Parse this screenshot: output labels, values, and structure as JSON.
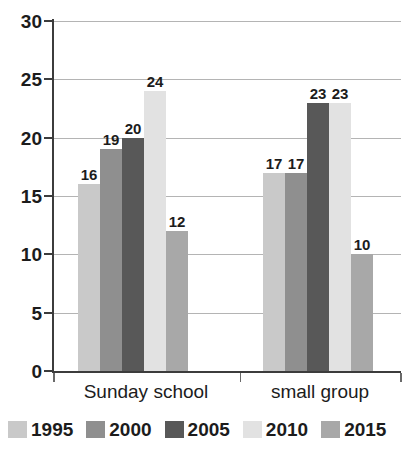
{
  "chart_data": {
    "type": "bar",
    "title": "",
    "xlabel": "",
    "ylabel": "",
    "ylim": [
      0,
      30
    ],
    "yticks": [
      0,
      5,
      10,
      15,
      20,
      25,
      30
    ],
    "grid": true,
    "legend_position": "bottom",
    "categories": [
      "Sunday school",
      "small group"
    ],
    "series": [
      {
        "name": "1995",
        "values": [
          16,
          17
        ],
        "color": "#c9c9c9"
      },
      {
        "name": "2000",
        "values": [
          19,
          17
        ],
        "color": "#8f8f8f"
      },
      {
        "name": "2005",
        "values": [
          20,
          23
        ],
        "color": "#585858"
      },
      {
        "name": "2010",
        "values": [
          24,
          23
        ],
        "color": "#e2e2e2"
      },
      {
        "name": "2015",
        "values": [
          12,
          10
        ],
        "color": "#a8a8a8"
      }
    ],
    "data_labels": {
      "Sunday school": [
        "16",
        "19",
        "20",
        "24",
        "12"
      ],
      "small group": [
        "17",
        "17",
        "23",
        "23",
        "10"
      ]
    }
  },
  "axis": {
    "y_tick_labels": [
      "30",
      "25",
      "20",
      "15",
      "10",
      "5",
      "0"
    ],
    "x_tick_labels": [
      "Sunday school",
      "small group"
    ]
  },
  "legend": {
    "items": [
      {
        "label": "1995"
      },
      {
        "label": "2000"
      },
      {
        "label": "2005"
      },
      {
        "label": "2010"
      },
      {
        "label": "2015"
      }
    ]
  },
  "colors": {
    "axis": "#3c3c3c",
    "gridline": "#b4b4b4",
    "text": "#1c1c1c",
    "background": "#ffffff"
  }
}
